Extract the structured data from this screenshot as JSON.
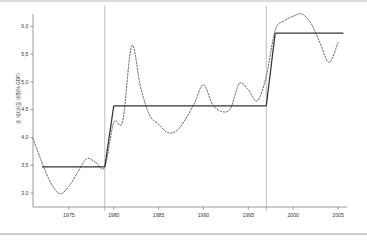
{
  "chart_data": {
    "type": "line",
    "title": "",
    "subtitle": "",
    "xlabel": "",
    "ylabel": "총 복지지출 비중(% GDP)",
    "xlim": [
      1971,
      2006
    ],
    "ylim": [
      2.75,
      6.15
    ],
    "xticks": [
      1975,
      1980,
      1985,
      1990,
      1995,
      2000,
      2005
    ],
    "xtick_labels": [
      "1975",
      "1980",
      "1985",
      "1990",
      "1995",
      "2000",
      "2005"
    ],
    "yticks": [
      3.0,
      3.5,
      4.0,
      4.5,
      5.0,
      5.5,
      6.0
    ],
    "ytick_labels": [
      "3,0",
      "3,5",
      "4,0",
      "4,5",
      "5,0",
      "5,5",
      "6,0"
    ],
    "grid": false,
    "legend": "none",
    "annotations": {
      "break_lines": [
        1979.0,
        1997.0
      ],
      "break_line_color": "#9aa0a6",
      "break_line_note": "structural break markers"
    },
    "series": [
      {
        "name": "observed",
        "style": "dashed",
        "color": "#555555",
        "x": [
          1971,
          1972,
          1973,
          1974,
          1975,
          1976,
          1977,
          1978,
          1979,
          1980,
          1981,
          1982,
          1983,
          1984,
          1985,
          1986,
          1987,
          1988,
          1989,
          1990,
          1991,
          1992,
          1993,
          1994,
          1995,
          1996,
          1997,
          1998,
          1999,
          2000,
          2001,
          2002,
          2003,
          2004,
          2005
        ],
        "values": [
          3.98,
          3.55,
          3.18,
          2.99,
          3.12,
          3.38,
          3.62,
          3.55,
          3.47,
          4.27,
          4.3,
          5.65,
          4.9,
          4.4,
          4.24,
          4.09,
          4.12,
          4.33,
          4.62,
          4.95,
          4.6,
          4.47,
          4.52,
          4.97,
          4.86,
          4.66,
          5.1,
          5.93,
          6.1,
          6.18,
          6.22,
          6.05,
          5.7,
          5.35,
          5.71
        ]
      },
      {
        "name": "fitted step mean",
        "style": "solid",
        "color": "#333333",
        "segments": [
          {
            "x_start": 1972.0,
            "x_end": 1979.0,
            "level": 3.47
          },
          {
            "x_start": 1980.0,
            "x_end": 1997.0,
            "level": 4.57
          },
          {
            "x_start": 1998.0,
            "x_end": 2005.6,
            "level": 5.88
          }
        ],
        "connectors": [
          {
            "x_start": 1979.0,
            "y_start": 3.47,
            "x_end": 1980.0,
            "y_end": 4.57
          },
          {
            "x_start": 1997.0,
            "y_start": 4.57,
            "x_end": 1998.0,
            "y_end": 5.88
          }
        ]
      }
    ]
  },
  "figure": {
    "background": "#ffffff",
    "axis_color": "#808080",
    "text_color": "#3a3a3a"
  }
}
